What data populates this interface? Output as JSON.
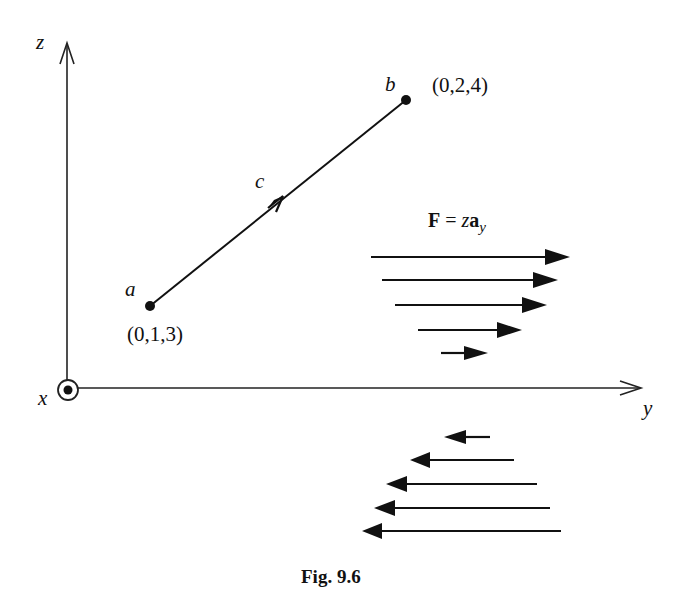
{
  "figure": {
    "caption": "Fig. 9.6",
    "axes": {
      "z_label": "z",
      "y_label": "y",
      "x_label": "x",
      "x_axis_symbol": "out-of-page (dot in circle)"
    },
    "points": {
      "a": {
        "label": "a",
        "coords": "(0,1,3)"
      },
      "b": {
        "label": "b",
        "coords": "(0,2,4)"
      }
    },
    "path": {
      "label": "c",
      "direction": "from a to b"
    },
    "field": {
      "F": "F",
      "equals": "=",
      "z": "z",
      "a": "a",
      "sub": "y",
      "upper_arrows": {
        "direction": "+y",
        "count": 5,
        "lengths_px": [
          198,
          170,
          150,
          105,
          45
        ]
      },
      "lower_arrows": {
        "direction": "-y",
        "count": 5,
        "lengths_px": [
          45,
          105,
          150,
          180,
          200
        ]
      }
    }
  }
}
